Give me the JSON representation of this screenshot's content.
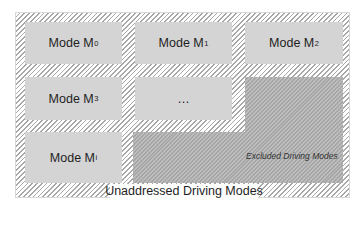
{
  "diagram": {
    "modes": [
      {
        "prefix": "Mode M",
        "sub": "0"
      },
      {
        "prefix": "Mode M",
        "sub": "1"
      },
      {
        "prefix": "Mode M",
        "sub": "2"
      },
      {
        "prefix": "Mode M",
        "sub": "3"
      },
      {
        "prefix": "…",
        "sub": ""
      },
      {
        "prefix": "Mode M",
        "sub": "i"
      }
    ],
    "excluded_label": "Excluded Driving Modes",
    "unaddressed_label": "Unaddressed Driving Modes",
    "colors": {
      "mode_box": "#d4d4d4",
      "excluded_region": "#b2b2b2",
      "hatch": "#a8a8a8"
    }
  }
}
